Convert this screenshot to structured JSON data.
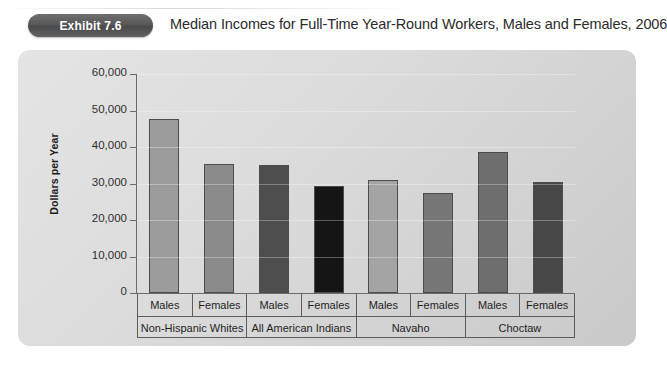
{
  "header": {
    "badge_label": "Exhibit 7.6",
    "title": "Median Incomes for Full-Time Year-Round Workers, Males and Females, 2006"
  },
  "chart_data": {
    "type": "bar",
    "title": "Median Incomes for Full-Time Year-Round Workers, Males and Females, 2006",
    "xlabel": "",
    "ylabel": "Dollars per Year",
    "ylim": [
      0,
      60000
    ],
    "ytick_labels": [
      "0",
      "10,000",
      "20,000",
      "30,000",
      "40,000",
      "50,000",
      "60,000"
    ],
    "ytick_values": [
      0,
      10000,
      20000,
      30000,
      40000,
      50000,
      60000
    ],
    "grid": false,
    "legend": "none",
    "groups": [
      {
        "label": "Non-Hispanic Whites",
        "subcategories": [
          "Males",
          "Females"
        ]
      },
      {
        "label": "All American Indians",
        "subcategories": [
          "Males",
          "Females"
        ]
      },
      {
        "label": "Navaho",
        "subcategories": [
          "Males",
          "Females"
        ]
      },
      {
        "label": "Choctaw",
        "subcategories": [
          "Males",
          "Females"
        ]
      }
    ],
    "categories": [
      "Non-Hispanic Whites Males",
      "Non-Hispanic Whites Females",
      "All American Indians Males",
      "All American Indians Females",
      "Navaho Males",
      "Navaho Females",
      "Choctaw Males",
      "Choctaw Females"
    ],
    "values": [
      47800,
      35400,
      35200,
      29200,
      31000,
      27400,
      38500,
      30300
    ],
    "bar_colors": [
      "#9c9c9c",
      "#8b8b8b",
      "#4e4e4e",
      "#151515",
      "#a4a4a4",
      "#777777",
      "#6e6e6e",
      "#474747"
    ]
  },
  "colors": {
    "panel_background": "#dcdcdc",
    "badge_background": "#585858",
    "axis": "#6a6a6a",
    "text": "#1f1f1f"
  }
}
